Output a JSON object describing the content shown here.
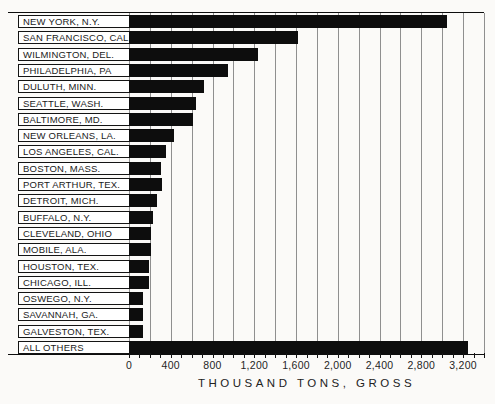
{
  "chart_data": {
    "type": "bar",
    "orientation": "horizontal",
    "title": "",
    "xlabel": "THOUSAND TONS, GROSS",
    "ylabel": "",
    "categories": [
      "NEW YORK, N.Y.",
      "SAN FRANCISCO, CAL.",
      "WILMINGTON, DEL.",
      "PHILADELPHIA, PA",
      "DULUTH, MINN.",
      "SEATTLE, WASH.",
      "BALTIMORE, MD.",
      "NEW ORLEANS, LA.",
      "LOS ANGELES, CAL.",
      "BOSTON, MASS.",
      "PORT ARTHUR, TEX.",
      "DETROIT, MICH.",
      "BUFFALO, N.Y.",
      "CLEVELAND, OHIO",
      "MOBILE, ALA.",
      "HOUSTON, TEX.",
      "CHICAGO, ILL.",
      "OSWEGO, N.Y.",
      "SAVANNAH, GA.",
      "GALVESTON, TEX.",
      "ALL OTHERS"
    ],
    "values": [
      3050,
      1620,
      1240,
      950,
      720,
      640,
      610,
      430,
      350,
      310,
      320,
      270,
      230,
      215,
      215,
      190,
      190,
      130,
      130,
      135,
      3250
    ],
    "xlim": [
      0,
      3400
    ],
    "tick_interval": 100,
    "gridline_interval": 200,
    "tick_label_interval": 400,
    "tick_labels": [
      "0",
      "400",
      "800",
      "1,200",
      "1,600",
      "2,000",
      "2,400",
      "2,800",
      "3,200"
    ],
    "tick_label_values": [
      0,
      400,
      800,
      1200,
      1600,
      2000,
      2400,
      2800,
      3200
    ],
    "grid": true,
    "legend": "none",
    "bar_color": "#0d0d0d",
    "gridline_color": "#8f8f8f",
    "label_box_background": "#ffffff",
    "page_background": "#fbfaf8"
  }
}
